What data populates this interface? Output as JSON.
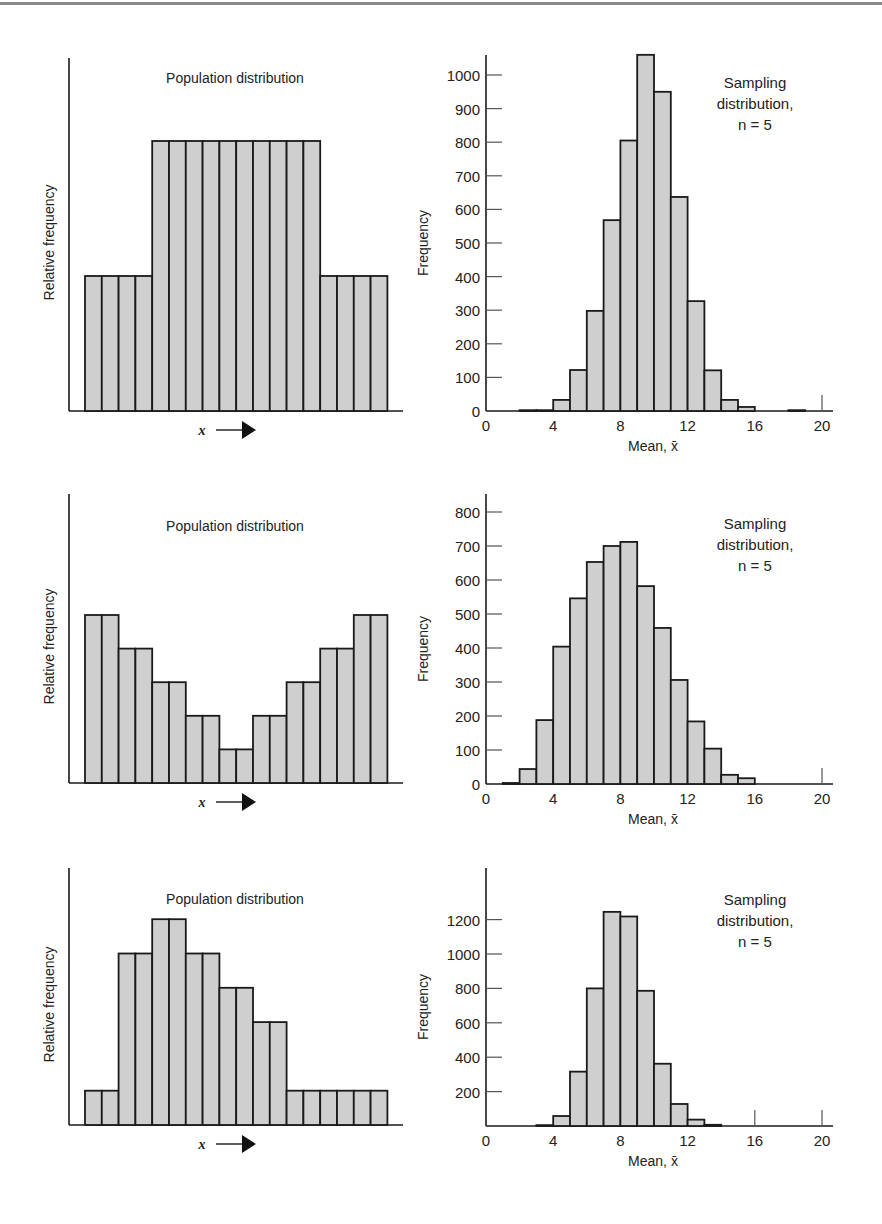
{
  "figure": {
    "panels": [
      {
        "population": {
          "title": "Population distribution",
          "ylabel": "Relative frequency",
          "xlabel": "x",
          "heights": [
            2,
            2,
            2,
            2,
            4,
            4,
            4,
            4,
            4,
            4,
            4,
            4,
            4,
            4,
            2,
            2,
            2,
            2
          ]
        },
        "sampling": {
          "title_lines": [
            "Sampling",
            "distribution,",
            "n = 5"
          ],
          "ylabel": "Frequency",
          "xlabel": "Mean, x̄",
          "yticks": [
            0,
            100,
            200,
            300,
            400,
            500,
            600,
            700,
            800,
            900,
            1000
          ],
          "xticks": [
            0,
            4,
            8,
            12,
            16,
            20
          ]
        }
      },
      {
        "population": {
          "title": "Population distribution",
          "ylabel": "Relative frequency",
          "xlabel": "x",
          "heights": [
            5,
            5,
            4,
            4,
            3,
            3,
            2,
            2,
            1,
            1,
            2,
            2,
            3,
            3,
            4,
            4,
            5,
            5
          ]
        },
        "sampling": {
          "title_lines": [
            "Sampling",
            "distribution,",
            "n = 5"
          ],
          "ylabel": "Frequency",
          "xlabel": "Mean, x̄",
          "yticks": [
            0,
            100,
            200,
            300,
            400,
            500,
            600,
            700,
            800
          ],
          "xticks": [
            0,
            4,
            8,
            12,
            16,
            20
          ]
        }
      },
      {
        "population": {
          "title": "Population distribution",
          "ylabel": "Relative frequency",
          "xlabel": "x",
          "heights": [
            1,
            1,
            5,
            5,
            6,
            6,
            5,
            5,
            4,
            4,
            3,
            3,
            1,
            1,
            1,
            1,
            1,
            1
          ]
        },
        "sampling": {
          "title_lines": [
            "Sampling",
            "distribution,",
            "n = 5"
          ],
          "ylabel": "Frequency",
          "xlabel": "Mean, x̄",
          "yticks": [
            200,
            400,
            600,
            800,
            1000,
            1200
          ],
          "xticks": [
            0,
            4,
            8,
            12,
            16,
            20
          ]
        }
      }
    ]
  },
  "chart_data": [
    {
      "type": "bar",
      "title": "Population distribution",
      "xlabel": "x →",
      "ylabel": "Relative frequency",
      "categories": [
        "1",
        "2",
        "3",
        "4",
        "5",
        "6",
        "7",
        "8",
        "9",
        "10",
        "11",
        "12",
        "13",
        "14",
        "15",
        "16",
        "17",
        "18"
      ],
      "values": [
        2,
        2,
        2,
        2,
        4,
        4,
        4,
        4,
        4,
        4,
        4,
        4,
        4,
        4,
        2,
        2,
        2,
        2
      ],
      "note": "uniform-like, relative units"
    },
    {
      "type": "bar",
      "title": "Sampling distribution, n = 5",
      "xlabel": "Mean, x̄",
      "ylabel": "Frequency",
      "x_bins": [
        [
          2,
          3
        ],
        [
          3,
          4
        ],
        [
          4,
          5
        ],
        [
          5,
          6
        ],
        [
          6,
          7
        ],
        [
          7,
          8
        ],
        [
          8,
          9
        ],
        [
          9,
          10
        ],
        [
          10,
          11
        ],
        [
          11,
          12
        ],
        [
          12,
          13
        ],
        [
          13,
          14
        ],
        [
          14,
          15
        ],
        [
          15,
          16
        ],
        [
          18,
          19
        ]
      ],
      "values": [
        1,
        2,
        33,
        122,
        298,
        568,
        805,
        1060,
        950,
        637,
        327,
        121,
        33,
        12,
        1
      ],
      "xlim": [
        0,
        20
      ],
      "ylim": [
        0,
        1060
      ],
      "yticks": [
        0,
        100,
        200,
        300,
        400,
        500,
        600,
        700,
        800,
        900,
        1000
      ],
      "xticks": [
        0,
        4,
        8,
        12,
        16,
        20
      ]
    },
    {
      "type": "bar",
      "title": "Population distribution",
      "xlabel": "x →",
      "ylabel": "Relative frequency",
      "categories": [
        "1",
        "2",
        "3",
        "4",
        "5",
        "6",
        "7",
        "8",
        "9",
        "10",
        "11",
        "12",
        "13",
        "14",
        "15",
        "16",
        "17",
        "18"
      ],
      "values": [
        5,
        5,
        4,
        4,
        3,
        3,
        2,
        2,
        1,
        1,
        2,
        2,
        3,
        3,
        4,
        4,
        5,
        5
      ],
      "note": "U-shaped, relative units"
    },
    {
      "type": "bar",
      "title": "Sampling distribution, n = 5",
      "xlabel": "Mean, x̄",
      "ylabel": "Frequency",
      "x_bins": [
        [
          1,
          2
        ],
        [
          2,
          3
        ],
        [
          3,
          4
        ],
        [
          4,
          5
        ],
        [
          5,
          6
        ],
        [
          6,
          7
        ],
        [
          7,
          8
        ],
        [
          8,
          9
        ],
        [
          9,
          10
        ],
        [
          10,
          11
        ],
        [
          11,
          12
        ],
        [
          12,
          13
        ],
        [
          13,
          14
        ],
        [
          14,
          15
        ],
        [
          15,
          16
        ]
      ],
      "values": [
        3,
        44,
        188,
        404,
        546,
        653,
        700,
        712,
        582,
        459,
        306,
        184,
        104,
        27,
        17
      ],
      "xlim": [
        0,
        20
      ],
      "ylim": [
        0,
        850
      ],
      "yticks": [
        0,
        100,
        200,
        300,
        400,
        500,
        600,
        700,
        800
      ],
      "xticks": [
        0,
        4,
        8,
        12,
        16,
        20
      ]
    },
    {
      "type": "bar",
      "title": "Population distribution",
      "xlabel": "x →",
      "ylabel": "Relative frequency",
      "categories": [
        "1",
        "2",
        "3",
        "4",
        "5",
        "6",
        "7",
        "8",
        "9",
        "10",
        "11",
        "12",
        "13",
        "14",
        "15",
        "16",
        "17",
        "18"
      ],
      "values": [
        1,
        1,
        5,
        5,
        6,
        6,
        5,
        5,
        4,
        4,
        3,
        3,
        1,
        1,
        1,
        1,
        1,
        1
      ],
      "note": "right-skewed, relative units"
    },
    {
      "type": "bar",
      "title": "Sampling distribution, n = 5",
      "xlabel": "Mean, x̄",
      "ylabel": "Frequency",
      "x_bins": [
        [
          3,
          4
        ],
        [
          4,
          5
        ],
        [
          5,
          6
        ],
        [
          6,
          7
        ],
        [
          7,
          8
        ],
        [
          8,
          9
        ],
        [
          9,
          10
        ],
        [
          10,
          11
        ],
        [
          11,
          12
        ],
        [
          12,
          13
        ],
        [
          13,
          14
        ]
      ],
      "values": [
        5,
        58,
        316,
        800,
        1245,
        1218,
        786,
        362,
        128,
        37,
        7
      ],
      "xlim": [
        0,
        20
      ],
      "ylim": [
        0,
        1450
      ],
      "yticks": [
        200,
        400,
        600,
        800,
        1000,
        1200
      ],
      "xticks": [
        0,
        4,
        8,
        12,
        16,
        20
      ]
    }
  ]
}
